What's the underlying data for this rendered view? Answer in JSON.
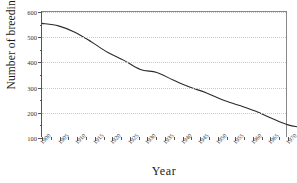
{
  "chart_data": {
    "type": "line",
    "title": "",
    "xlabel": "Year",
    "ylabel": "Number of breeding pairs",
    "xlim": [
      1900,
      1975
    ],
    "ylim": [
      100,
      600
    ],
    "grid": true,
    "legend": "none",
    "y_ticks": [
      100,
      200,
      300,
      400,
      500,
      600
    ],
    "y_minor_step": 50,
    "x_tick_labels": [
      "1900",
      "1905",
      "1910",
      "1915",
      "1920",
      "1925",
      "1930",
      "1935",
      "1940",
      "1945",
      "1950",
      "1955",
      "1960",
      "1965",
      "1970"
    ],
    "x": [
      1900,
      1905,
      1910,
      1915,
      1920,
      1925,
      1930,
      1935,
      1940,
      1945,
      1950,
      1955,
      1960,
      1965,
      1970,
      1975
    ],
    "values": [
      555,
      545,
      520,
      480,
      440,
      405,
      370,
      360,
      330,
      300,
      275,
      250,
      230,
      205,
      180,
      165
    ],
    "series": [
      {
        "name": "Breeding pairs",
        "color": "#2b2b2b",
        "x": [
          1900,
          1905,
          1910,
          1915,
          1920,
          1925,
          1930,
          1935,
          1940,
          1945,
          1950,
          1955,
          1960,
          1965,
          1970,
          1975,
          1980,
          1985,
          1990,
          1995,
          2000,
          2005,
          2010,
          2015
        ],
        "values": [
          555,
          545,
          520,
          482,
          440,
          408,
          372,
          360,
          330,
          302,
          280,
          252,
          230,
          207,
          178,
          152,
          140,
          131,
          124,
          118,
          115,
          118,
          130,
          160
        ]
      }
    ],
    "points": [
      {
        "x": 1900,
        "y": 555
      },
      {
        "x": 1905,
        "y": 545
      },
      {
        "x": 1910,
        "y": 520
      },
      {
        "x": 1915,
        "y": 482
      },
      {
        "x": 1920,
        "y": 440
      },
      {
        "x": 1925,
        "y": 408
      },
      {
        "x": 1930,
        "y": 372
      },
      {
        "x": 1935,
        "y": 360
      },
      {
        "x": 1940,
        "y": 330
      },
      {
        "x": 1945,
        "y": 302
      },
      {
        "x": 1950,
        "y": 280
      },
      {
        "x": 1955,
        "y": 252
      },
      {
        "x": 1960,
        "y": 230
      },
      {
        "x": 1965,
        "y": 207
      },
      {
        "x": 1970,
        "y": 178
      },
      {
        "x": 1975,
        "y": 152
      },
      {
        "x": 1980,
        "y": 140
      },
      {
        "x": 1985,
        "y": 131
      },
      {
        "x": 1990,
        "y": 124
      },
      {
        "x": 1995,
        "y": 118
      },
      {
        "x": 2000,
        "y": 115
      },
      {
        "x": 2005,
        "y": 118
      },
      {
        "x": 2010,
        "y": 130
      },
      {
        "x": 2015,
        "y": 160
      }
    ]
  }
}
